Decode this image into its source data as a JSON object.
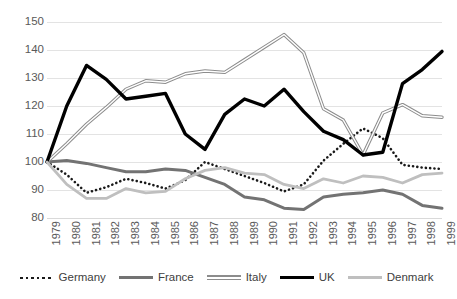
{
  "chart_data": {
    "type": "line",
    "title": "",
    "subtitle": "",
    "xlabel": "",
    "ylabel": "",
    "x": [
      1979,
      1980,
      1981,
      1982,
      1983,
      1984,
      1985,
      1986,
      1987,
      1988,
      1989,
      1990,
      1991,
      1992,
      1993,
      1994,
      1995,
      1996,
      1997,
      1998,
      1999
    ],
    "categories": [
      "1979",
      "1980",
      "1981",
      "1982",
      "1983",
      "1984",
      "1985",
      "1986",
      "1987",
      "1988",
      "1989",
      "1990",
      "1991",
      "1992",
      "1993",
      "1994",
      "1995",
      "1996",
      "1997",
      "1998",
      "1999"
    ],
    "ylim": [
      80,
      150
    ],
    "yticks": [
      80,
      90,
      100,
      110,
      120,
      130,
      140,
      150
    ],
    "grid": true,
    "legend_position": "bottom",
    "series": [
      {
        "name": "Germany",
        "color": "#1a1a1a",
        "style": "dotted",
        "width": 2.6,
        "values": [
          100.0,
          95.5,
          89.0,
          91.0,
          94.0,
          92.5,
          90.5,
          93.5,
          100.0,
          97.5,
          95.0,
          92.5,
          89.5,
          92.0,
          100.5,
          106.5,
          112.0,
          108.5,
          99.0,
          98.0,
          97.5
        ]
      },
      {
        "name": "France",
        "color": "#737373",
        "style": "solid",
        "width": 3.0,
        "values": [
          100.0,
          100.5,
          99.5,
          98.0,
          96.5,
          96.5,
          97.5,
          97.0,
          94.5,
          92.0,
          87.5,
          86.5,
          83.5,
          83.0,
          87.5,
          88.5,
          89.0,
          90.0,
          88.5,
          84.5,
          83.5
        ]
      },
      {
        "name": "Italy",
        "color": "#8c8c8c",
        "style": "double",
        "width": 1.2,
        "values": [
          100.0,
          106.5,
          113.5,
          119.5,
          126.0,
          129.0,
          128.5,
          131.5,
          132.5,
          132.0,
          136.5,
          141.0,
          145.5,
          139.0,
          119.0,
          115.0,
          102.5,
          117.5,
          120.5,
          116.5,
          116.0
        ]
      },
      {
        "name": "UK",
        "color": "#000000",
        "style": "solid",
        "width": 3.4,
        "values": [
          100.0,
          120.0,
          134.5,
          129.5,
          122.5,
          123.5,
          124.5,
          110.0,
          104.5,
          117.0,
          122.5,
          120.0,
          126.0,
          118.0,
          111.0,
          108.0,
          102.5,
          103.5,
          128.0,
          133.0,
          139.5
        ]
      },
      {
        "name": "Denmark",
        "color": "#bfbfbf",
        "style": "solid",
        "width": 2.8,
        "values": [
          100.0,
          92.0,
          87.0,
          87.0,
          90.5,
          89.0,
          89.5,
          94.0,
          97.0,
          98.0,
          96.0,
          95.5,
          92.0,
          90.5,
          94.0,
          92.5,
          95.0,
          94.5,
          92.5,
          95.5,
          96.0
        ]
      }
    ]
  },
  "legend": {
    "items": [
      {
        "label": "Germany",
        "name": "legend-item-germany"
      },
      {
        "label": "France",
        "name": "legend-item-france"
      },
      {
        "label": "Italy",
        "name": "legend-item-italy"
      },
      {
        "label": "UK",
        "name": "legend-item-uk"
      },
      {
        "label": "Denmark",
        "name": "legend-item-denmark"
      }
    ]
  },
  "colors": {
    "germany": "#1a1a1a",
    "france": "#737373",
    "italy": "#8c8c8c",
    "uk": "#000000",
    "denmark": "#bfbfbf",
    "grid": "#e3e3e3",
    "tick_text": "#595959",
    "legend_text": "#404040",
    "background": "#ffffff"
  }
}
